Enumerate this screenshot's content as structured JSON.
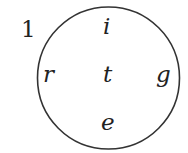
{
  "diagram": {
    "number_label": "1",
    "circle": {
      "stroke": "#333333"
    },
    "letters": {
      "top": "i",
      "left": "r",
      "center": "t",
      "right": "g",
      "bottom": "e"
    }
  }
}
